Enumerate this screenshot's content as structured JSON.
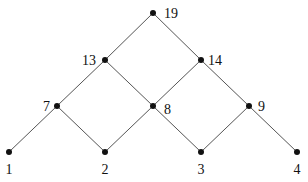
{
  "diagram": {
    "type": "lattice",
    "nodes": [
      {
        "id": "19",
        "label": "19",
        "x": 153,
        "y": 13,
        "lx": 164,
        "ly": 18,
        "anchor": "start"
      },
      {
        "id": "13",
        "label": "13",
        "x": 105,
        "y": 60,
        "lx": 96,
        "ly": 65,
        "anchor": "end"
      },
      {
        "id": "14",
        "label": "14",
        "x": 201,
        "y": 60,
        "lx": 208,
        "ly": 65,
        "anchor": "start"
      },
      {
        "id": "7",
        "label": "7",
        "x": 57,
        "y": 106,
        "lx": 50,
        "ly": 111,
        "anchor": "end"
      },
      {
        "id": "8",
        "label": "8",
        "x": 153,
        "y": 106,
        "lx": 164,
        "ly": 114,
        "anchor": "start"
      },
      {
        "id": "9",
        "label": "9",
        "x": 249,
        "y": 106,
        "lx": 258,
        "ly": 111,
        "anchor": "start"
      },
      {
        "id": "1",
        "label": "1",
        "x": 9,
        "y": 152,
        "lx": 9,
        "ly": 174,
        "anchor": "middle"
      },
      {
        "id": "2",
        "label": "2",
        "x": 105,
        "y": 152,
        "lx": 105,
        "ly": 174,
        "anchor": "middle"
      },
      {
        "id": "3",
        "label": "3",
        "x": 201,
        "y": 152,
        "lx": 201,
        "ly": 174,
        "anchor": "middle"
      },
      {
        "id": "4",
        "label": "4",
        "x": 297,
        "y": 152,
        "lx": 297,
        "ly": 174,
        "anchor": "middle"
      }
    ],
    "edges": [
      [
        "19",
        "13"
      ],
      [
        "19",
        "14"
      ],
      [
        "13",
        "7"
      ],
      [
        "13",
        "8"
      ],
      [
        "14",
        "8"
      ],
      [
        "14",
        "9"
      ],
      [
        "7",
        "1"
      ],
      [
        "7",
        "2"
      ],
      [
        "8",
        "2"
      ],
      [
        "8",
        "3"
      ],
      [
        "9",
        "3"
      ],
      [
        "9",
        "4"
      ]
    ]
  }
}
